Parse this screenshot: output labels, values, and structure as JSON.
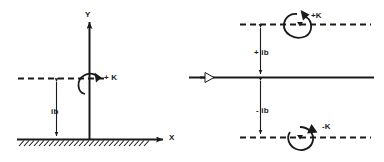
{
  "diagram": {
    "ink_color": "#1a1a1a",
    "background_color": "#ffffff",
    "left_panel": {
      "name": "s-plane axes with ground",
      "axis_y_label": "Y",
      "axis_x_label": "X",
      "height_label": "ib",
      "rotation_label": "+ K",
      "rotation_direction": "counterclockwise",
      "ground_hatching": true
    },
    "right_panel": {
      "name": "conjugate pole pair on real axis",
      "offset_upper_label": "+ ib",
      "offset_lower_label": "- ib",
      "rotation_upper_label": "+K",
      "rotation_upper_direction": "counterclockwise",
      "rotation_lower_label": "-K",
      "rotation_lower_direction": "clockwise",
      "real_axis_marker": "hollow-arrowhead"
    }
  }
}
